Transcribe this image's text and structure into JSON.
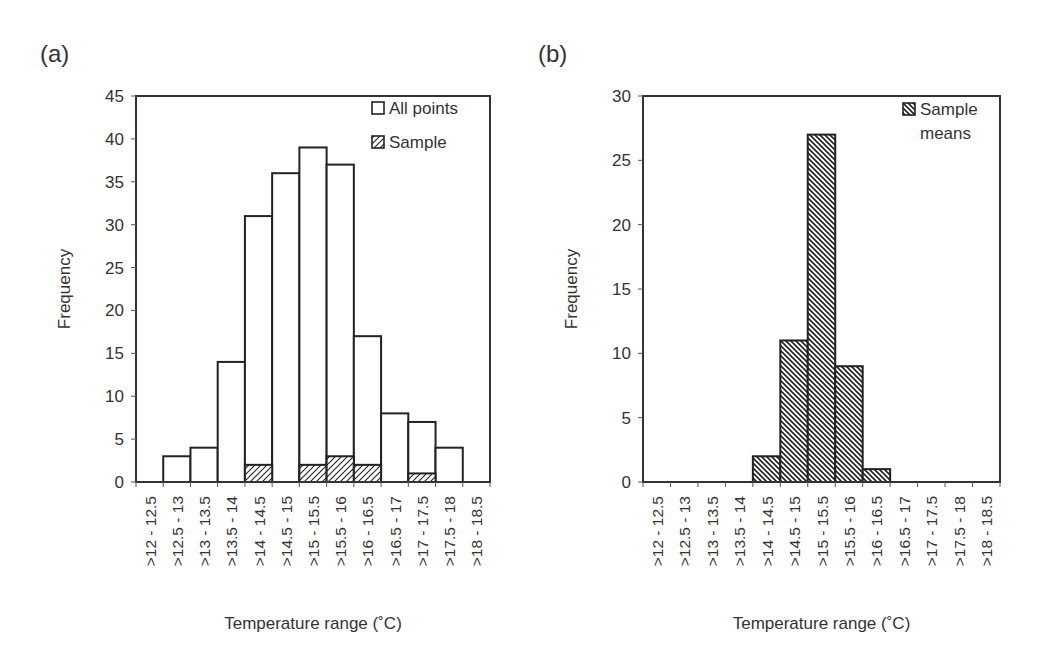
{
  "panels": {
    "a_label": "(a)",
    "b_label": "(b)"
  },
  "chart_data": [
    {
      "type": "bar",
      "panel": "(a)",
      "categories": [
        ">12 - 12.5",
        ">12.5 - 13",
        ">13 - 13.5",
        ">13.5 - 14",
        ">14 - 14.5",
        ">14.5 - 15",
        ">15 - 15.5",
        ">15.5 - 16",
        ">16 - 16.5",
        ">16.5 - 17",
        ">17 - 17.5",
        ">17.5 - 18",
        ">18 - 18.5"
      ],
      "series": [
        {
          "name": "All points",
          "pattern": "none",
          "values": [
            0,
            3,
            4,
            14,
            31,
            36,
            39,
            37,
            17,
            8,
            7,
            4,
            0
          ]
        },
        {
          "name": "Sample",
          "pattern": "diagonal-hatch",
          "values": [
            0,
            0,
            0,
            0,
            2,
            0,
            2,
            3,
            2,
            0,
            1,
            0,
            0
          ]
        }
      ],
      "title": "",
      "xlabel": "Temperature range (˚C)",
      "ylabel": "Frequency",
      "ylim": [
        0,
        45
      ],
      "yticks": [
        0,
        5,
        10,
        15,
        20,
        25,
        30,
        35,
        40,
        45
      ],
      "grid": false,
      "legend_position": "top-right"
    },
    {
      "type": "bar",
      "panel": "(b)",
      "categories": [
        ">12 - 12.5",
        ">12.5 - 13",
        ">13 - 13.5",
        ">13.5 - 14",
        ">14 - 14.5",
        ">14.5 - 15",
        ">15 - 15.5",
        ">15.5 - 16",
        ">16 - 16.5",
        ">16.5 - 17",
        ">17 - 17.5",
        ">17.5 - 18",
        ">18 - 18.5"
      ],
      "series": [
        {
          "name": "Sample means",
          "pattern": "dense-diagonal-hatch",
          "values": [
            0,
            0,
            0,
            0,
            2,
            11,
            27,
            9,
            1,
            0,
            0,
            0,
            0
          ]
        }
      ],
      "title": "",
      "xlabel": "Temperature range (˚C)",
      "ylabel": "Frequency",
      "ylim": [
        0,
        30
      ],
      "yticks": [
        0,
        5,
        10,
        15,
        20,
        25,
        30
      ],
      "grid": false,
      "legend_position": "top-right"
    }
  ]
}
